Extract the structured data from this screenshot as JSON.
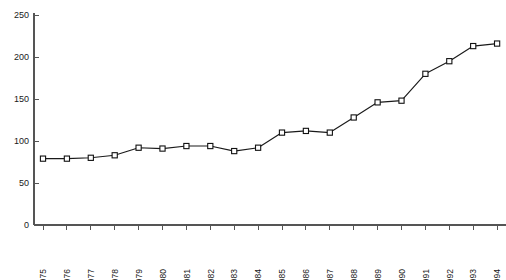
{
  "chart_data": {
    "type": "line",
    "title": "",
    "subtitle": "",
    "xlabel": "",
    "ylabel": "",
    "categories": [
      "1975",
      "1976",
      "1977",
      "1978",
      "1979",
      "1980",
      "1981",
      "1982",
      "1983",
      "1984",
      "1985",
      "1986",
      "1987",
      "1988",
      "1989",
      "1990",
      "1991",
      "1992",
      "1993",
      "1994"
    ],
    "values": [
      79,
      79,
      80,
      83,
      92,
      91,
      94,
      94,
      88,
      92,
      110,
      112,
      110,
      128,
      146,
      148,
      180,
      195,
      213,
      216
    ],
    "series": [
      {
        "name": "",
        "values": [
          79,
          79,
          80,
          83,
          92,
          91,
          94,
          94,
          88,
          92,
          110,
          112,
          110,
          128,
          146,
          148,
          180,
          195,
          213,
          216
        ]
      }
    ],
    "ylim": [
      0,
      250
    ],
    "yticks": [
      0,
      50,
      100,
      150,
      200,
      250
    ],
    "ytick_labels": [
      "0",
      "50",
      "100",
      "150",
      "200",
      "250"
    ],
    "xtick_labels": [
      "1975",
      "1976",
      "1977",
      "1978",
      "1979",
      "1980",
      "1981",
      "1982",
      "1983",
      "1984",
      "1985",
      "1986",
      "1987",
      "1988",
      "1989",
      "1990",
      "1991",
      "1992",
      "1993",
      "1994"
    ],
    "grid": false,
    "legend": null,
    "legend_position": "none",
    "marker": "open-square",
    "annotations": [],
    "colors": {
      "line": "#1a1a1a",
      "marker_fill": "#ffffff",
      "marker_stroke": "#111111",
      "axis": "#555555",
      "text": "#1a1a1a",
      "background": "#ffffff"
    }
  }
}
